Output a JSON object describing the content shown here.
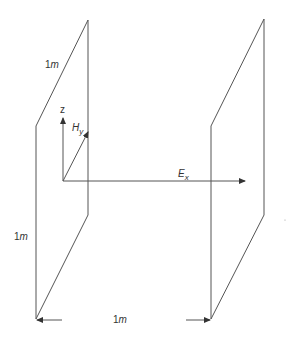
{
  "diagram": {
    "colors": {
      "line": "#555555",
      "text": "#333333",
      "background": "#ffffff"
    },
    "labels": {
      "plate_top_edge": {
        "value": "1",
        "unit": "m"
      },
      "plate_height": {
        "value": "1",
        "unit": "m"
      },
      "separation": {
        "value": "1",
        "unit": "m"
      },
      "z_axis": "z",
      "h_field": {
        "base": "H",
        "sub": "y"
      },
      "e_field": {
        "base": "E",
        "sub": "x"
      }
    },
    "plates": [
      {
        "name": "left-plate"
      },
      {
        "name": "right-plate"
      }
    ],
    "arrows": [
      "z-axis",
      "H_y",
      "E_x",
      "separation-left",
      "separation-right"
    ]
  }
}
